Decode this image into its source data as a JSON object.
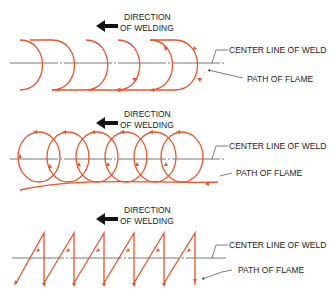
{
  "colors": {
    "path": "#e8542a",
    "line": "#555555",
    "text": "#222222",
    "background": "#ffffff"
  },
  "panels": [
    {
      "id": "semicircular",
      "direction_label": [
        "DIRECTION",
        "OF WELDING"
      ],
      "centerline_label": "CENTER LINE OF WELD",
      "flame_label": "PATH OF FLAME"
    },
    {
      "id": "circular",
      "direction_label": [
        "DIRECTION",
        "OF WELDING"
      ],
      "centerline_label": "CENTER LINE OF WELD",
      "flame_label": "PATH OF FLAME"
    },
    {
      "id": "zigzag",
      "direction_label": [
        "DIRECTION",
        "OF WELDING"
      ],
      "centerline_label": "CENTER LINE OF WELD",
      "flame_label": "PATH OF FLAME"
    }
  ]
}
